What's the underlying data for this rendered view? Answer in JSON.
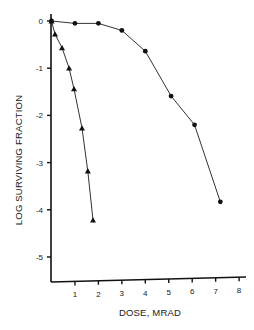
{
  "chart_data": {
    "type": "line",
    "title": "",
    "xlabel": "DOSE, MRAD",
    "ylabel": "LOG SURVIVING FRACTION",
    "xlim": [
      0,
      8.3
    ],
    "ylim": [
      -5.5,
      0.1
    ],
    "x_ticks": [
      1,
      2,
      3,
      4,
      5,
      6,
      7,
      8
    ],
    "x_tick_labels": [
      "1",
      "2",
      "3",
      "4",
      "5",
      "6",
      "7",
      "8"
    ],
    "y_ticks": [
      0,
      -1,
      -2,
      -3,
      -4,
      -5
    ],
    "y_tick_labels": [
      "0",
      "-1",
      "-2",
      "-3",
      "-4",
      "-5"
    ],
    "grid": false,
    "legend": null,
    "series": [
      {
        "name": "circles",
        "marker": "circle",
        "x": [
          0,
          1.0,
          2.0,
          3.0,
          4.0,
          5.1,
          6.1,
          7.2
        ],
        "y": [
          0,
          -0.05,
          -0.05,
          -0.2,
          -0.64,
          -1.59,
          -2.2,
          -3.83
        ]
      },
      {
        "name": "triangles",
        "marker": "triangle",
        "x": [
          0,
          0.15,
          0.45,
          0.75,
          0.96,
          1.3,
          1.55,
          1.77
        ],
        "y": [
          0,
          -0.28,
          -0.57,
          -1.0,
          -1.44,
          -2.27,
          -3.18,
          -4.22
        ]
      }
    ]
  }
}
